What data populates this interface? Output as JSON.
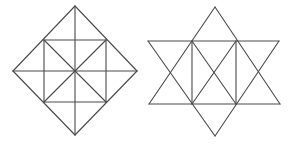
{
  "figures": [
    {
      "id": "diamond",
      "name": "square-in-diamond-figure",
      "stroke": "#4a4a4a",
      "lines": [
        [
          75,
          6,
          137,
          71
        ],
        [
          137,
          71,
          75,
          135
        ],
        [
          75,
          135,
          13,
          71
        ],
        [
          13,
          71,
          75,
          6
        ],
        [
          13,
          71,
          137,
          71
        ],
        [
          75,
          6,
          75,
          135
        ],
        [
          44,
          40,
          106,
          40
        ],
        [
          106,
          40,
          106,
          102
        ],
        [
          106,
          102,
          44,
          102
        ],
        [
          44,
          102,
          44,
          40
        ],
        [
          44,
          40,
          106,
          102
        ],
        [
          106,
          40,
          44,
          102
        ]
      ]
    },
    {
      "id": "star",
      "name": "six-point-star-figure",
      "stroke": "#4a4a4a",
      "lines": [
        [
          215,
          7,
          149,
          104
        ],
        [
          215,
          7,
          280,
          104
        ],
        [
          149,
          104,
          280,
          104
        ],
        [
          215,
          136,
          148,
          41
        ],
        [
          215,
          136,
          279,
          41
        ],
        [
          148,
          41,
          279,
          41
        ],
        [
          192,
          41,
          192,
          104
        ],
        [
          236,
          41,
          236,
          104
        ],
        [
          192,
          41,
          236,
          104
        ],
        [
          236,
          41,
          192,
          104
        ]
      ]
    }
  ]
}
